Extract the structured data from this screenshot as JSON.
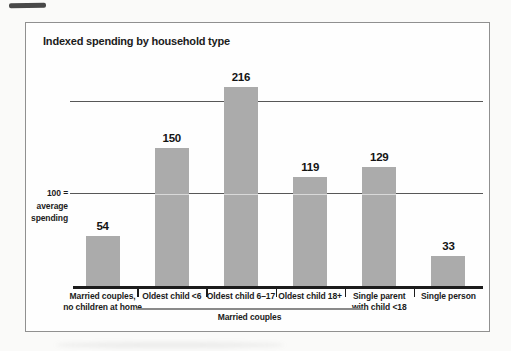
{
  "chart": {
    "title": "Indexed spending by household type",
    "y_axis_note_lines": [
      "100 =",
      "average",
      "spending"
    ],
    "group_bracket_label": "Married couples",
    "bars": [
      {
        "value": "54",
        "label_line1": "Married couples,",
        "label_line2": "no children at home"
      },
      {
        "value": "150",
        "label_line1": "Oldest child <6",
        "label_line2": ""
      },
      {
        "value": "216",
        "label_line1": "Oldest child 6–17",
        "label_line2": ""
      },
      {
        "value": "119",
        "label_line1": "Oldest child 18+",
        "label_line2": ""
      },
      {
        "value": "129",
        "label_line1": "Single parent",
        "label_line2": "with child <18"
      },
      {
        "value": "33",
        "label_line1": "Single person",
        "label_line2": ""
      }
    ],
    "colors": {
      "bar": "#ababab",
      "gridline": "#575757",
      "axis": "#1c1c1c",
      "text": "#1b1b1b",
      "frame_border": "#909090",
      "background": "#fefefe"
    }
  },
  "chart_data": {
    "type": "bar",
    "categories": [
      "Married couples, no children at home",
      "Oldest child <6",
      "Oldest child 6–17",
      "Oldest child 18+",
      "Single parent with child <18",
      "Single person"
    ],
    "values": [
      54,
      150,
      216,
      119,
      129,
      33
    ],
    "title": "Indexed spending by household type",
    "xlabel": "",
    "ylabel": "100 = average spending",
    "ylim": [
      0,
      240
    ],
    "gridlines_y": [
      100,
      200
    ],
    "grid": "horizontal lines at 100 and 200 only",
    "legend": "none",
    "bar_color": "#ababab",
    "group_annotation": {
      "label": "Married couples",
      "spans_category_indices": [
        1,
        2,
        3
      ]
    }
  }
}
